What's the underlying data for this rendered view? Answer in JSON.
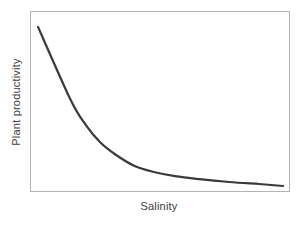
{
  "figure": {
    "ylabel": "Plant productivity",
    "xlabel": "Salinity"
  },
  "colors": {
    "curve": "#3a3a3a",
    "plot_border": "#b3b3b3",
    "label_text": "#3d3d3d",
    "background": "#ffffff"
  },
  "chart_data": {
    "type": "line",
    "title": "",
    "xlabel": "Salinity",
    "ylabel": "Plant productivity",
    "x_range": [
      0,
      1
    ],
    "y_range": [
      0,
      1
    ],
    "axis_ticks": "none",
    "tick_labels": [],
    "grid": false,
    "legend": "none",
    "frame": "full box",
    "series": [
      {
        "name": "Plant productivity vs Salinity",
        "color": "#3a3a3a",
        "stroke_width": 2.2,
        "x": [
          0.027,
          0.154,
          0.212,
          0.269,
          0.327,
          0.404,
          0.481,
          0.558,
          0.654,
          0.769,
          0.885,
          0.977
        ],
        "y": [
          0.917,
          0.508,
          0.37,
          0.271,
          0.204,
          0.138,
          0.105,
          0.083,
          0.066,
          0.05,
          0.039,
          0.028
        ]
      }
    ]
  }
}
